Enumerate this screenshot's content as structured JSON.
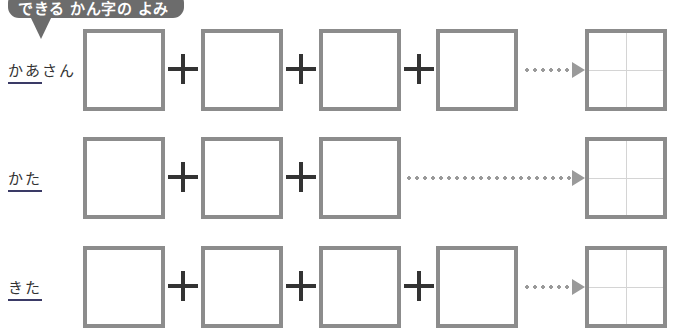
{
  "header": {
    "banner_text": "できる かん字の よみ"
  },
  "rows": [
    {
      "label_underlined": "かあ",
      "label_rest": "さん",
      "input_boxes": 4,
      "plus_count": 3
    },
    {
      "label_underlined": "かた",
      "label_rest": "",
      "input_boxes": 3,
      "plus_count": 2
    },
    {
      "label_underlined": "きた",
      "label_rest": "",
      "input_boxes": 4,
      "plus_count": 3
    }
  ],
  "colors": {
    "banner": "#6c6c6c",
    "box_border": "#8c8c8c",
    "plus": "#333333",
    "dots_arrow": "#9a9a9a",
    "answer_grid": "#d4d4d4"
  }
}
